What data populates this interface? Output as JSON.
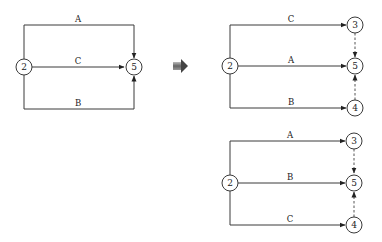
{
  "diagram": {
    "type": "activity-on-arrow network transformation",
    "original": {
      "nodes": [
        "2",
        "5"
      ],
      "edges": [
        {
          "label": "A",
          "from": "2",
          "to": "5",
          "route": "top"
        },
        {
          "label": "C",
          "from": "2",
          "to": "5",
          "route": "middle"
        },
        {
          "label": "B",
          "from": "2",
          "to": "5",
          "route": "bottom"
        }
      ]
    },
    "transform_arrow": "right-arrow",
    "variant_1": {
      "nodes": [
        "2",
        "3",
        "5",
        "4"
      ],
      "edges": [
        {
          "label": "C",
          "from": "2",
          "to": "3"
        },
        {
          "label": "A",
          "from": "2",
          "to": "5"
        },
        {
          "label": "B",
          "from": "2",
          "to": "4"
        }
      ],
      "dummies": [
        {
          "from": "3",
          "to": "5"
        },
        {
          "from": "4",
          "to": "5"
        }
      ]
    },
    "variant_2": {
      "nodes": [
        "2",
        "3",
        "5",
        "4"
      ],
      "edges": [
        {
          "label": "A",
          "from": "2",
          "to": "3"
        },
        {
          "label": "B",
          "from": "2",
          "to": "5"
        },
        {
          "label": "C",
          "from": "2",
          "to": "4"
        }
      ],
      "dummies": [
        {
          "from": "3",
          "to": "5"
        },
        {
          "from": "4",
          "to": "5"
        }
      ]
    }
  },
  "labels": {
    "left": {
      "n2": "2",
      "n5": "5",
      "top": "A",
      "mid": "C",
      "bot": "B"
    },
    "r1": {
      "n2": "2",
      "n3": "3",
      "n5": "5",
      "n4": "4",
      "top": "C",
      "mid": "A",
      "bot": "B"
    },
    "r2": {
      "n2": "2",
      "n3": "3",
      "n5": "5",
      "n4": "4",
      "top": "A",
      "mid": "B",
      "bot": "C"
    }
  }
}
